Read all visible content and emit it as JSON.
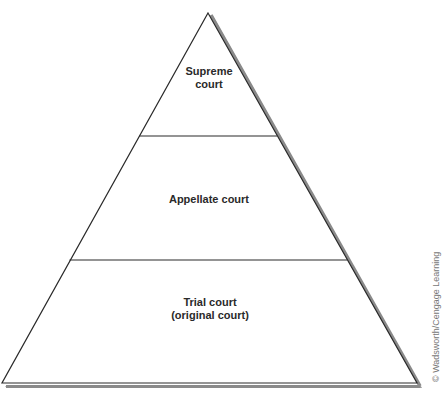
{
  "diagram": {
    "type": "pyramid",
    "tiers": [
      {
        "id": "supreme",
        "lines": [
          "Supreme",
          "court"
        ]
      },
      {
        "id": "appellate",
        "lines": [
          "Appellate court"
        ]
      },
      {
        "id": "trial",
        "lines": [
          "Trial court",
          "(original court)"
        ]
      }
    ],
    "credit": "© Wadsworth/Cengage Learning"
  },
  "colors": {
    "outline": "#2a2a2a",
    "shadow": "#888888",
    "fill": "#ffffff"
  }
}
